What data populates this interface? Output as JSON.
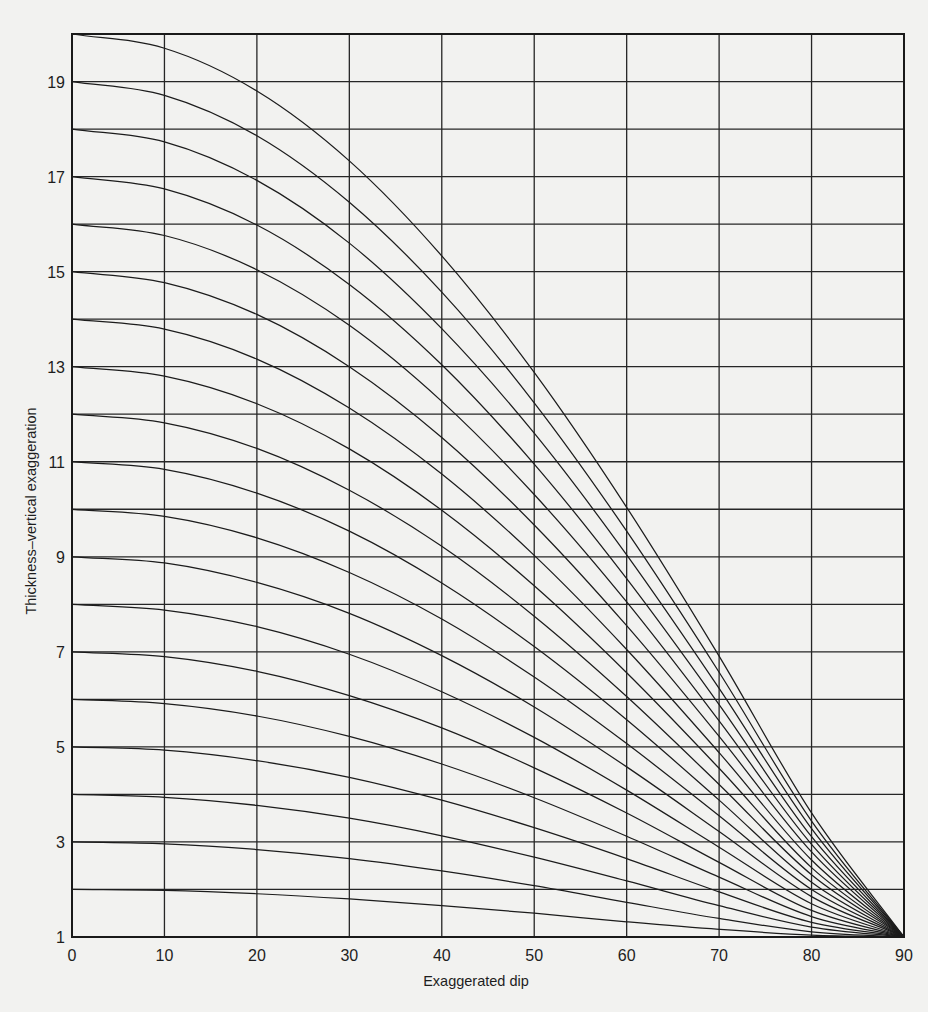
{
  "chart_data": {
    "type": "line",
    "title": "",
    "xlabel": "Exaggerated dip",
    "ylabel": "Thickness–vertical exaggeration",
    "xlim": [
      0,
      90
    ],
    "ylim": [
      1,
      20
    ],
    "grid": true,
    "legend": "none",
    "x_ticks": [
      0,
      10,
      20,
      30,
      40,
      50,
      60,
      70,
      80,
      90
    ],
    "x_tick_labels": [
      "0",
      "10",
      "20",
      "30",
      "40",
      "50",
      "60",
      "70",
      "80",
      "90"
    ],
    "y_gridlines": [
      1,
      2,
      3,
      4,
      5,
      6,
      7,
      8,
      9,
      10,
      11,
      12,
      13,
      14,
      15,
      16,
      17,
      18,
      19,
      20
    ],
    "y_ticks_labeled": [
      1,
      3,
      5,
      7,
      9,
      11,
      13,
      15,
      17,
      19
    ],
    "y_tick_labels": [
      "1",
      "3",
      "5",
      "7",
      "9",
      "11",
      "13",
      "15",
      "17",
      "19"
    ],
    "x": [
      0,
      10,
      20,
      30,
      40,
      50,
      60,
      70,
      80,
      90
    ],
    "series": [
      {
        "name": "2",
        "values": [
          2,
          1.98,
          1.91,
          1.8,
          1.66,
          1.5,
          1.32,
          1.16,
          1.04,
          1
        ]
      },
      {
        "name": "3",
        "values": [
          3,
          2.96,
          2.84,
          2.65,
          2.39,
          2.08,
          1.73,
          1.39,
          1.11,
          1
        ]
      },
      {
        "name": "4",
        "values": [
          4,
          3.94,
          3.77,
          3.5,
          3.13,
          2.68,
          2.18,
          1.66,
          1.21,
          1
        ]
      },
      {
        "name": "5",
        "values": [
          5,
          4.93,
          4.71,
          4.36,
          3.88,
          3.3,
          2.65,
          1.95,
          1.31,
          1
        ]
      },
      {
        "name": "6",
        "values": [
          6,
          5.91,
          5.65,
          5.22,
          4.64,
          3.93,
          3.12,
          2.26,
          1.43,
          1
        ]
      },
      {
        "name": "7",
        "values": [
          7,
          6.9,
          6.59,
          6.08,
          5.4,
          4.56,
          3.61,
          2.57,
          1.56,
          1
        ]
      },
      {
        "name": "8",
        "values": [
          8,
          7.88,
          7.53,
          6.95,
          6.16,
          5.2,
          4.09,
          2.89,
          1.7,
          1
        ]
      },
      {
        "name": "9",
        "values": [
          9,
          8.87,
          8.46,
          7.81,
          6.92,
          5.84,
          4.58,
          3.22,
          1.85,
          1
        ]
      },
      {
        "name": "10",
        "values": [
          10,
          9.85,
          9.4,
          8.67,
          7.69,
          6.47,
          5.07,
          3.55,
          2.0,
          1
        ]
      },
      {
        "name": "11",
        "values": [
          11,
          10.84,
          10.34,
          9.54,
          8.45,
          7.11,
          5.57,
          3.88,
          2.15,
          1
        ]
      },
      {
        "name": "12",
        "values": [
          12,
          11.82,
          11.28,
          10.4,
          9.22,
          7.75,
          6.06,
          4.21,
          2.31,
          1
        ]
      },
      {
        "name": "13",
        "values": [
          13,
          12.8,
          12.22,
          11.27,
          9.98,
          8.39,
          6.56,
          4.55,
          2.46,
          1
        ]
      },
      {
        "name": "14",
        "values": [
          14,
          13.79,
          13.16,
          12.13,
          10.74,
          9.03,
          7.05,
          4.88,
          2.62,
          1
        ]
      },
      {
        "name": "15",
        "values": [
          15,
          14.77,
          14.1,
          13.0,
          11.51,
          9.67,
          7.55,
          5.22,
          2.79,
          1
        ]
      },
      {
        "name": "16",
        "values": [
          16,
          15.76,
          15.04,
          13.87,
          12.27,
          10.31,
          8.05,
          5.55,
          2.95,
          1
        ]
      },
      {
        "name": "17",
        "values": [
          17,
          16.74,
          15.98,
          14.73,
          13.04,
          10.95,
          8.54,
          5.89,
          3.11,
          1
        ]
      },
      {
        "name": "18",
        "values": [
          18,
          17.73,
          16.92,
          15.6,
          13.8,
          11.6,
          9.04,
          6.23,
          3.28,
          1
        ]
      },
      {
        "name": "19",
        "values": [
          19,
          18.71,
          17.86,
          16.46,
          14.57,
          12.24,
          9.54,
          6.57,
          3.44,
          1
        ]
      },
      {
        "name": "20",
        "values": [
          20,
          19.7,
          18.8,
          17.33,
          15.33,
          12.88,
          10.04,
          6.91,
          3.61,
          1
        ]
      }
    ]
  },
  "colors": {
    "background": "#f2f2f0",
    "ink": "#1e1e1e"
  }
}
